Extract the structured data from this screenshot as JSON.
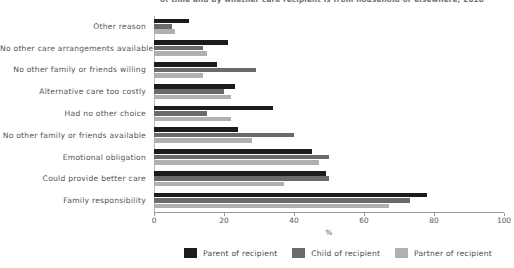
{
  "title": {
    "text": "of time and by whether care recipient is from household or elsewhere, 2018"
  },
  "legend": {
    "position": "bottom",
    "items": [
      {
        "label": "Parent of recipient",
        "color": "#1c1c1c"
      },
      {
        "label": "Child of recipient",
        "color": "#6a6a6a"
      },
      {
        "label": "Partner of recipient",
        "color": "#b0b0b0"
      }
    ]
  },
  "axes": {
    "xlabel": "%",
    "xticks": [
      "0",
      "20",
      "40",
      "60",
      "80",
      "100"
    ]
  },
  "chart_data": {
    "type": "bar",
    "orientation": "horizontal",
    "title": "of time and by whether care recipient is from household or elsewhere, 2018",
    "xlabel": "%",
    "ylabel": "",
    "xlim": [
      0,
      100
    ],
    "xticks": [
      0,
      20,
      40,
      60,
      80,
      100
    ],
    "grid": false,
    "legend_position": "bottom",
    "categories": [
      "Other reason",
      "No other care arrangements available",
      "No other family or friends willing",
      "Alternative care too costly",
      "Had no other choice",
      "No other family or friends available",
      "Emotional obligation",
      "Could provide better care",
      "Family responsibility"
    ],
    "series": [
      {
        "name": "Parent of recipient",
        "color": "#1c1c1c",
        "values": [
          10,
          21,
          18,
          23,
          34,
          24,
          45,
          49,
          78
        ]
      },
      {
        "name": "Child of recipient",
        "color": "#6a6a6a",
        "values": [
          5,
          14,
          29,
          20,
          15,
          40,
          50,
          50,
          73
        ]
      },
      {
        "name": "Partner of recipient",
        "color": "#b0b0b0",
        "values": [
          6,
          15,
          14,
          22,
          22,
          28,
          47,
          37,
          67
        ]
      }
    ]
  }
}
